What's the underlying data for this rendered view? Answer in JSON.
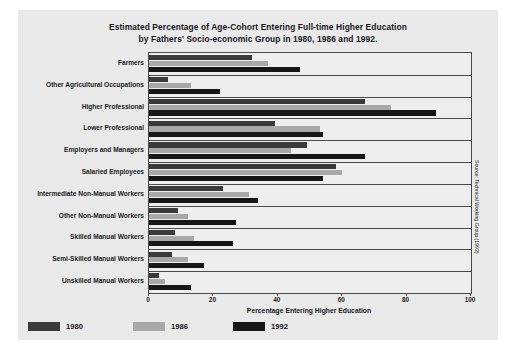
{
  "chart_data": {
    "type": "bar",
    "orientation": "horizontal",
    "title": "Estimated Percentage of Age-Cohort Entering Full-time Higher Education by Fathers' Socio-economic Group in 1980, 1986 and 1992.",
    "title_line1": "Estimated Percentage of Age-Cohort Entering Full-time Higher Education",
    "title_line2": "by Fathers' Socio-economic Group in 1980, 1986 and 1992.",
    "xlabel": "Percentage Entering Higher Education",
    "ylabel": "",
    "xlim": [
      0,
      100
    ],
    "xticks": [
      0,
      20,
      40,
      60,
      80,
      100
    ],
    "xticklabels": [
      "0",
      "20",
      "40",
      "60",
      "80",
      "100"
    ],
    "grid": false,
    "legend_position": "below-left",
    "categories": [
      "Farmers",
      "Other Agricultural Occupations",
      "Higher Professional",
      "Lower Professional",
      "Employers and Managers",
      "Salaried Employees",
      "Intermediate Non-Manual Workers",
      "Other Non-Manual Workers",
      "Skilled Manual Workers",
      "Semi-Skilled Manual Workers",
      "Unskilled Manual Workers"
    ],
    "series": [
      {
        "name": "1980",
        "color": "#3a3a3a",
        "values": [
          32,
          6,
          67,
          39,
          49,
          58,
          23,
          9,
          8,
          7,
          3
        ]
      },
      {
        "name": "1986",
        "color": "#a8a8a8",
        "values": [
          37,
          13,
          75,
          53,
          44,
          60,
          31,
          12,
          14,
          12,
          5
        ]
      },
      {
        "name": "1992",
        "color": "#161616",
        "values": [
          47,
          22,
          89,
          54,
          67,
          54,
          34,
          27,
          26,
          17,
          13
        ]
      }
    ],
    "source_note": "Source: Technical Working Group (1993)"
  }
}
